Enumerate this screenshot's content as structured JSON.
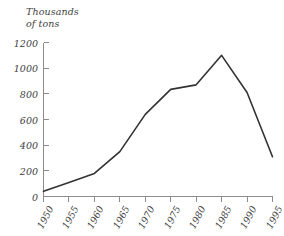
{
  "chart_data": {
    "type": "line",
    "title": "",
    "subtitle": "",
    "ylabel": "Thousands\nof tons",
    "xlabel": "",
    "categories": [
      "1950",
      "1955",
      "1960",
      "1965",
      "1970",
      "1975",
      "1980",
      "1985",
      "1990",
      "1995"
    ],
    "x": [
      1950,
      1955,
      1960,
      1965,
      1970,
      1975,
      1980,
      1985,
      1990,
      1995
    ],
    "values": [
      40,
      110,
      180,
      350,
      640,
      835,
      870,
      1100,
      810,
      310
    ],
    "series": [
      {
        "name": "tons",
        "values": [
          40,
          110,
          180,
          350,
          640,
          835,
          870,
          1100,
          810,
          310
        ]
      }
    ],
    "yticks": [
      0,
      200,
      400,
      600,
      800,
      1000,
      1200
    ],
    "ytick_labels": [
      "0",
      "200",
      "400",
      "600",
      "800",
      "1000",
      "1200"
    ],
    "ylim": [
      0,
      1200
    ],
    "xlim": [
      1950,
      1995
    ],
    "grid": false,
    "legend": false,
    "legend_position": "none",
    "line_color": "#333333",
    "axis_color": "#8c8c8c",
    "background_color": "#ffffff",
    "text_color": "#3d3d3d"
  }
}
